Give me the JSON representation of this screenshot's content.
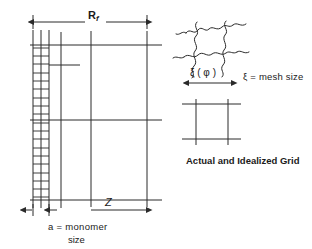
{
  "figure": {
    "background_color": "#ffffff",
    "ink_color": "#2a2a2a",
    "labels": {
      "rf_main": "R",
      "rf_sub": "f",
      "z": "Z",
      "monomer": "a = monomer",
      "monomer_second_line": "size",
      "xi_phi": "ξ ( φ )",
      "mesh_size": "ξ = mesh size",
      "actual_idealized": "Actual and Idealized Grid"
    }
  },
  "diagram_data": {
    "type": "schematic-diagram",
    "left_panel": {
      "name": "grid-with-ladder",
      "vertical_lines_x": [
        33,
        41,
        49,
        61,
        91,
        147
      ],
      "horizontal_lines_y": [
        45,
        120,
        200
      ],
      "horizontal_line_x_start": 30,
      "horizontal_line_x_end": 162,
      "vertical_line_y_start": 30,
      "vertical_line_y_end": 208,
      "ladder": {
        "left_x": 33,
        "right_x": 49,
        "top_y": 48,
        "bottom_y": 197,
        "rung_count": 18
      },
      "stub_line": {
        "y": 65,
        "x_start": 49,
        "x_end": 80
      },
      "rf_arrow": {
        "y": 22,
        "x_start": 33,
        "x_end": 147
      },
      "z_arrow": {
        "y": 210,
        "x_start": 91,
        "x_end": 147
      },
      "a_arrow": {
        "y": 210,
        "x_start": 33,
        "x_end": 49
      }
    },
    "right_panel": {
      "name": "mesh-cell-comparison",
      "actual_mesh": {
        "cell_left": 196,
        "cell_right": 228,
        "cell_top": 28,
        "cell_bottom": 60,
        "style": "wavy-squiggly-strands"
      },
      "xi_arrow": {
        "y": 83,
        "x_start": 188,
        "x_end": 232
      },
      "idealized_grid": {
        "cell_left": 196,
        "cell_right": 228,
        "cell_top": 104,
        "cell_bottom": 139,
        "style": "straight-crossing-lines"
      }
    }
  }
}
